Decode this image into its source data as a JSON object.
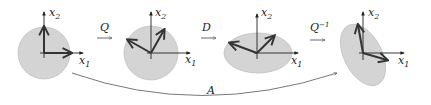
{
  "diagram": {
    "colors": {
      "shape_fill": "#d4d4d4",
      "shape_stroke": "#bdbdbd",
      "axis": "#222222",
      "vector": "#333333",
      "curve": "#555555"
    },
    "axis_labels": {
      "x1": "x",
      "x1_sub": "1",
      "x2": "x",
      "x2_sub": "2"
    },
    "panels": [
      {
        "name": "original-circle",
        "shape": "circle"
      },
      {
        "name": "rotated-circle",
        "shape": "circle"
      },
      {
        "name": "scaled-ellipse",
        "shape": "ellipse"
      },
      {
        "name": "rotated-ellipse",
        "shape": "ellipse"
      }
    ],
    "transforms": [
      {
        "label": "Q",
        "sup": ""
      },
      {
        "label": "D",
        "sup": ""
      },
      {
        "label": "Q",
        "sup": "−1"
      }
    ],
    "overall": {
      "label": "A"
    }
  }
}
